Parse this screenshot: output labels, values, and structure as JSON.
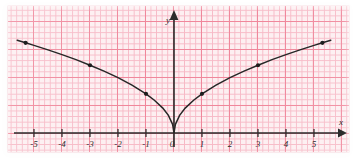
{
  "figure": {
    "kind": "coordinate-grid-plot",
    "paper": {
      "background_color": "#fdeff1",
      "minor_grid_color": "#f7b9c6",
      "major_grid_color": "#f0879b",
      "minor_grid_px": 5.6,
      "major_grid_px": 28
    },
    "axis_color": "#2b2b2b",
    "curve_color": "#272727"
  },
  "chart_data": {
    "type": "line",
    "title": "",
    "xlabel": "x",
    "ylabel": "y",
    "grid": true,
    "legend": "none",
    "xlim": [
      -5.6,
      5.9
    ],
    "ylim": [
      -0.6,
      4.1
    ],
    "xticks": [
      -5,
      -4,
      -3,
      -2,
      -1,
      0,
      1,
      2,
      3,
      4,
      5
    ],
    "xtick_labels": [
      "-5",
      "-4",
      "-3",
      "-2",
      "-1",
      "0",
      "1",
      "2",
      "3",
      "4",
      "5"
    ],
    "yticks": [],
    "ytick_labels": [],
    "equation": "y = 1.4*sqrt(|x|)",
    "series": [
      {
        "name": "y = 1.4*sqrt(|x|)",
        "x": [
          -5.6,
          -5.3,
          -5,
          -4.5,
          -4,
          -3.5,
          -3,
          -2.5,
          -2,
          -1.5,
          -1,
          -0.7,
          -0.4,
          -0.2,
          -0.05,
          0,
          0.05,
          0.2,
          0.4,
          0.7,
          1,
          1.5,
          2,
          2.5,
          3,
          3.5,
          4,
          4.5,
          5,
          5.3,
          5.6
        ],
        "y": [
          3.31,
          3.22,
          3.13,
          2.97,
          2.8,
          2.62,
          2.42,
          2.21,
          1.98,
          1.71,
          1.4,
          1.17,
          0.89,
          0.63,
          0.31,
          0,
          0.31,
          0.63,
          0.89,
          1.17,
          1.4,
          1.71,
          1.98,
          2.21,
          2.42,
          2.62,
          2.8,
          2.97,
          3.13,
          3.22,
          3.31
        ]
      }
    ],
    "marked_points": [
      {
        "x": -5.3,
        "y": 3.22
      },
      {
        "x": -3,
        "y": 2.42
      },
      {
        "x": -1,
        "y": 1.4
      },
      {
        "x": 1,
        "y": 1.4
      },
      {
        "x": 3,
        "y": 2.42
      },
      {
        "x": 5.3,
        "y": 3.22
      }
    ],
    "annotations": [
      {
        "name": "x-axis-label",
        "text": "x"
      },
      {
        "name": "y-axis-label",
        "text": "y"
      }
    ]
  },
  "labels": {
    "x_axis": "x",
    "y_axis": "y",
    "xticks": [
      "-5",
      "-4",
      "-3",
      "-2",
      "-1",
      "0",
      "1",
      "2",
      "3",
      "4",
      "5"
    ]
  }
}
